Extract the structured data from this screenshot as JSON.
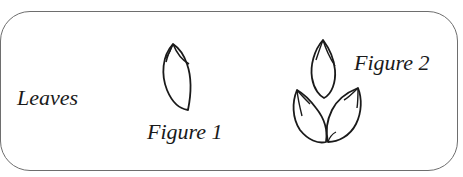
{
  "diagram": {
    "labels": {
      "leaves": "Leaves",
      "figure1": "Figure 1",
      "figure2": "Figure 2"
    },
    "figures": [
      {
        "id": "figure-1",
        "description": "single leaf drawing",
        "leaf_count": 1
      },
      {
        "id": "figure-2",
        "description": "three leaves arranged in a cluster (one on top, two below)",
        "leaf_count": 3
      }
    ],
    "colors": {
      "stroke": "#1a1a1a",
      "frame_border": "#6e6e6e",
      "background": "#ffffff"
    }
  }
}
